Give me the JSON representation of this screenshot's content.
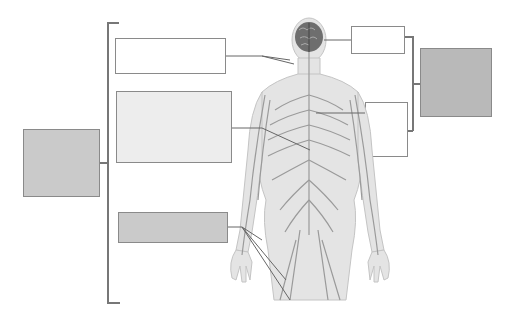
{
  "diagram": {
    "colors": {
      "box_white": "#ffffff",
      "box_light": "#ededed",
      "box_gray": "#cacaca",
      "box_dark": "#b9b9b9",
      "line": "#777777",
      "figure_skin": "#e2e2e2",
      "nerves": "#9a9a9a",
      "brain": "#6e6e6e"
    },
    "label_boxes": {
      "left_category": "",
      "left_top": "",
      "left_middle": "",
      "left_bottom": "",
      "right_top": "",
      "right_middle": "",
      "right_category": ""
    }
  }
}
